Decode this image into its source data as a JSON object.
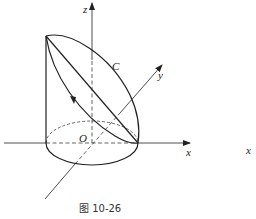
{
  "figure": {
    "caption": "图 10-26",
    "labels": {
      "z_axis": "z",
      "y_axis": "y",
      "x_axis": "x",
      "origin": "O",
      "curve": "C",
      "stray_x": "x"
    },
    "colors": {
      "stroke": "#222222",
      "background": "#ffffff"
    }
  }
}
